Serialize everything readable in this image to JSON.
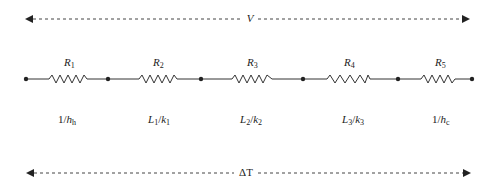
{
  "diagram": {
    "type": "thermal-resistance-network",
    "top_span": {
      "label": "V",
      "direction": "bidirectional"
    },
    "bottom_span": {
      "label": "ΔT",
      "direction": "bidirectional"
    },
    "resistors": [
      {
        "name": "R",
        "index": "1",
        "value_num": "1/",
        "value_var": "h",
        "value_sub": "h",
        "value_den": ""
      },
      {
        "name": "R",
        "index": "2",
        "value_num": "L",
        "value_num_sub": "1",
        "value_var": "k",
        "value_sub": "1"
      },
      {
        "name": "R",
        "index": "3",
        "value_num": "L",
        "value_num_sub": "2",
        "value_var": "k",
        "value_sub": "2"
      },
      {
        "name": "R",
        "index": "4",
        "value_num": "L",
        "value_num_sub": "3",
        "value_var": "k",
        "value_sub": "3"
      },
      {
        "name": "R",
        "index": "5",
        "value_num": "1/",
        "value_var": "h",
        "value_sub": "c"
      }
    ],
    "node_count": 6,
    "colors": {
      "line": "#333333",
      "text": "#222222",
      "background": "#ffffff"
    }
  }
}
